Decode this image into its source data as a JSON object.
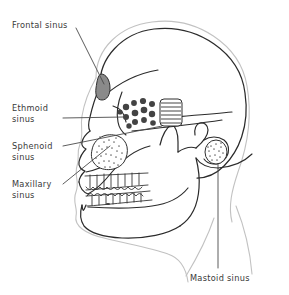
{
  "figure": {
    "type": "anatomical-diagram",
    "background_color": "#ffffff",
    "bone_outline_color": "#2b2b2b",
    "soft_tissue_outline_color": "#bdbdbd",
    "text_color": "#3a3a3a",
    "leader_line_color": "#4a4a4a"
  },
  "labels": {
    "frontal": {
      "line1": "Frontal sinus",
      "line2": "",
      "x": 12,
      "y": 25
    },
    "ethmoid": {
      "line1": "Ethmoid",
      "line2": "sinus",
      "x": 12,
      "y": 108
    },
    "sphenoid": {
      "line1": "Sphenoid",
      "line2": "sinus",
      "x": 12,
      "y": 146
    },
    "maxillary": {
      "line1": "Maxillary",
      "line2": "sinus",
      "x": 12,
      "y": 185
    },
    "mastoid": {
      "line1": "Mastoid sinus",
      "line2": "",
      "x": 190,
      "y": 278
    }
  },
  "sinus_regions": [
    {
      "name": "frontal-sinus",
      "fill_style": "solid-gray",
      "fill_color": "#8a8a8a",
      "shape": "teardrop",
      "cx": 104,
      "cy": 85
    },
    {
      "name": "ethmoid-sinus",
      "fill_style": "dark-dots",
      "fill_color": "#4a4a4a",
      "shape": "air-cell-cluster",
      "cx": 143,
      "cy": 112
    },
    {
      "name": "sphenoid-sinus",
      "fill_style": "horizontal-hatch",
      "fill_color": "#6e6e6e",
      "shape": "rounded-rectangle",
      "cx": 171,
      "cy": 113
    },
    {
      "name": "maxillary-sinus",
      "fill_style": "stipple",
      "fill_color": "#7d7d7d",
      "shape": "oval",
      "cx": 107,
      "cy": 152
    },
    {
      "name": "mastoid-sinus",
      "fill_style": "stipple",
      "fill_color": "#7d7d7d",
      "shape": "small-oval",
      "cx": 216,
      "cy": 153
    }
  ]
}
